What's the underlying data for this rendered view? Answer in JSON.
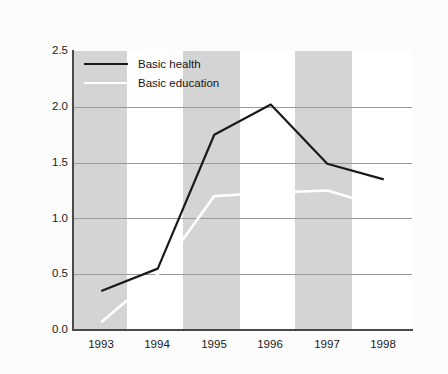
{
  "chart_data": {
    "type": "line",
    "title": "",
    "subtitle": "",
    "xlabel": "",
    "ylabel": "",
    "x": [
      "1993",
      "1994",
      "1995",
      "1996",
      "1997",
      "1998"
    ],
    "categories": [
      "1993",
      "1994",
      "1995",
      "1996",
      "1997",
      "1998"
    ],
    "series": [
      {
        "name": "Basic health",
        "color": "#1a1a1a",
        "values": [
          0.35,
          0.55,
          1.75,
          2.02,
          1.49,
          1.35
        ]
      },
      {
        "name": "Basic education",
        "color": "#ffffff",
        "values": [
          0.07,
          0.5,
          1.2,
          1.23,
          1.25,
          1.1
        ]
      }
    ],
    "xlim": [
      1992.5,
      1998.5
    ],
    "ylim": [
      0.0,
      2.5
    ],
    "ytick_labels": [
      "0.0",
      "0.5",
      "1.0",
      "1.5",
      "2.0",
      "2.5"
    ],
    "ytick_values": [
      0.0,
      0.5,
      1.0,
      1.5,
      2.0,
      2.5
    ],
    "xtick_labels": [
      "1993",
      "1994",
      "1995",
      "1996",
      "1997",
      "1998"
    ],
    "grid": "horizontal",
    "legend_position": "top-left",
    "alternating_band_color": "#d4d4d4",
    "plot_background": "#ffffff",
    "axis_color": "#4a4a4a",
    "gridline_color": "#9a9a9a",
    "banded_categories": [
      "1993",
      "1995",
      "1997"
    ]
  },
  "legend": {
    "entries": [
      {
        "label": "Basic health",
        "color": "#1a1a1a"
      },
      {
        "label": "Basic education",
        "color": "#ffffff"
      }
    ]
  },
  "axes": {
    "y_ticks": [
      {
        "label": "2.5"
      },
      {
        "label": "2.0"
      },
      {
        "label": "1.5"
      },
      {
        "label": "1.0"
      },
      {
        "label": "0.5"
      },
      {
        "label": "0.0"
      }
    ],
    "x_ticks": [
      {
        "label": "1993"
      },
      {
        "label": "1994"
      },
      {
        "label": "1995"
      },
      {
        "label": "1996"
      },
      {
        "label": "1997"
      },
      {
        "label": "1998"
      }
    ]
  }
}
